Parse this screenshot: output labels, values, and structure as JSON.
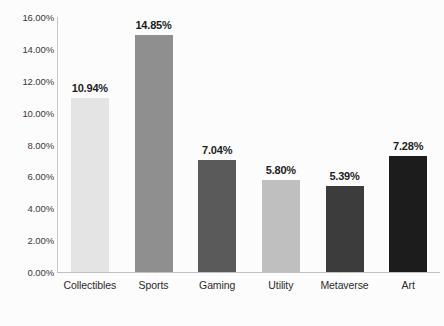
{
  "chart_data": {
    "type": "bar",
    "title": "",
    "subtitle": "",
    "xlabel": "",
    "ylabel": "",
    "categories": [
      "Collectibles",
      "Sports",
      "Gaming",
      "Utility",
      "Metaverse",
      "Art"
    ],
    "values": [
      10.94,
      14.85,
      7.04,
      5.8,
      5.39,
      7.28
    ],
    "value_labels": [
      "10.94%",
      "14.85%",
      "7.04%",
      "5.80%",
      "5.39%",
      "7.28%"
    ],
    "bar_colors": [
      "#e4e4e4",
      "#8f8f8f",
      "#5a5a5a",
      "#bfbfbf",
      "#3c3c3c",
      "#1c1c1c"
    ],
    "ylim": [
      0,
      16
    ],
    "ytick_labels": [
      "0.00%",
      "2.00%",
      "4.00%",
      "6.00%",
      "8.00%",
      "10.00%",
      "12.00%",
      "14.00%",
      "16.00%"
    ],
    "ytick_values": [
      0,
      2,
      4,
      6,
      8,
      10,
      12,
      14,
      16
    ],
    "grid": false,
    "legend": "none",
    "axis_color": "#c4c4c4",
    "label_color": "#1d1d1d",
    "background": "#fcfcfc"
  }
}
